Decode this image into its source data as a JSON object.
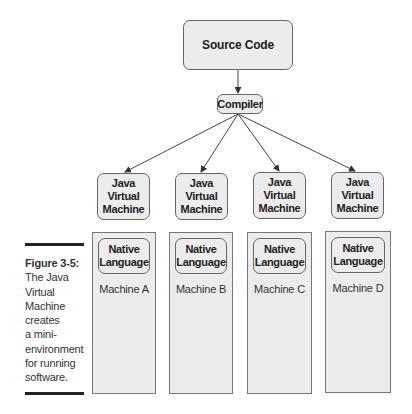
{
  "diagram": {
    "source": "Source Code",
    "compiler": "Compiler",
    "machines": [
      {
        "jvm": [
          "Java",
          "Virtual",
          "Machine"
        ],
        "native": [
          "Native",
          "Language"
        ],
        "label": "Machine A"
      },
      {
        "jvm": [
          "Java",
          "Virtual",
          "Machine"
        ],
        "native": [
          "Native",
          "Language"
        ],
        "label": "Machine B"
      },
      {
        "jvm": [
          "Java",
          "Virtual",
          "Machine"
        ],
        "native": [
          "Native",
          "Language"
        ],
        "label": "Machine C"
      },
      {
        "jvm": [
          "Java",
          "Virtual",
          "Machine"
        ],
        "native": [
          "Native",
          "Language"
        ],
        "label": "Machine D"
      }
    ]
  },
  "caption": {
    "figure": "Figure 3-5:",
    "lines": [
      "The Java",
      "Virtual",
      "Machine",
      "creates",
      "a mini-",
      "environment",
      "for running",
      "software."
    ]
  },
  "colors": {
    "box_fill": "#ececec",
    "border": "#666666",
    "rule": "#222222"
  }
}
